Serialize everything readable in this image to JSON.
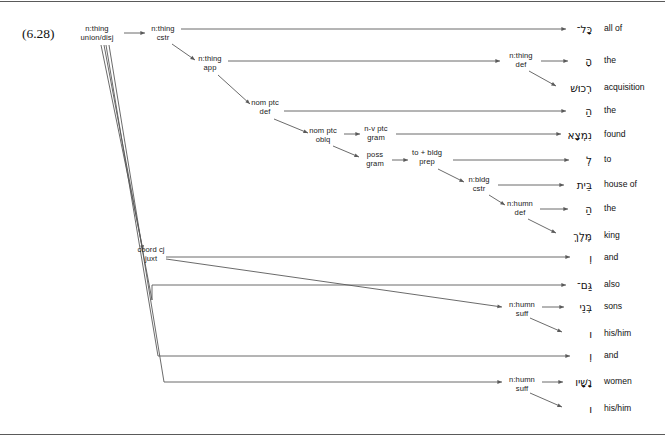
{
  "figure": {
    "number": "(6.28)",
    "width": 665,
    "height": 436,
    "line_color": "#5a5a5a",
    "text_color": "#111111"
  },
  "nodes": [
    {
      "id": "root",
      "line1": "n:thing",
      "line2": "union/disj",
      "x": 97,
      "y": 34
    },
    {
      "id": "thing-cstr",
      "line1": "n:thing",
      "line2": "cstr",
      "x": 163,
      "y": 34
    },
    {
      "id": "thing-app",
      "line1": "n:thing",
      "line2": "app",
      "x": 210,
      "y": 64
    },
    {
      "id": "nom-ptc-def",
      "line1": "nom ptc",
      "line2": "def",
      "x": 265,
      "y": 108
    },
    {
      "id": "nom-ptc-oblq",
      "line1": "nom ptc",
      "line2": "oblq",
      "x": 323,
      "y": 136
    },
    {
      "id": "nv-ptc-gram",
      "line1": "n-v ptc",
      "line2": "gram",
      "x": 376,
      "y": 134
    },
    {
      "id": "poss-gram",
      "line1": "poss",
      "line2": "gram",
      "x": 375,
      "y": 160
    },
    {
      "id": "to-bldg-prep",
      "line1": "to + bldg",
      "line2": "prep",
      "x": 427,
      "y": 158
    },
    {
      "id": "n-bldg-cstr",
      "line1": "n:bldg",
      "line2": "cstr",
      "x": 479,
      "y": 185
    },
    {
      "id": "n-humn-def",
      "line1": "n:humn",
      "line2": "def",
      "x": 520,
      "y": 209
    },
    {
      "id": "thing-def",
      "line1": "n:thing",
      "line2": "def",
      "x": 521,
      "y": 61
    },
    {
      "id": "coord-cj",
      "line1": "coord cj",
      "line2": "juxt",
      "x": 151,
      "y": 255
    },
    {
      "id": "humn-suff-1",
      "line1": "n:humn",
      "line2": "suff",
      "x": 522,
      "y": 310
    },
    {
      "id": "humn-suff-2",
      "line1": "n:humn",
      "line2": "suff",
      "x": 522,
      "y": 385
    }
  ],
  "leaves": [
    {
      "id": "leaf-kol",
      "hebrew": "כָּל־",
      "gloss": "all of",
      "hx": 592,
      "y": 29
    },
    {
      "id": "leaf-ha-1",
      "hebrew": "הָ",
      "gloss": "the",
      "hx": 592,
      "y": 61
    },
    {
      "id": "leaf-rekush",
      "hebrew": "רְכוּשׁ",
      "gloss": "acquisition",
      "hx": 592,
      "y": 88
    },
    {
      "id": "leaf-ha-2",
      "hebrew": "הַ",
      "gloss": "the",
      "hx": 592,
      "y": 111
    },
    {
      "id": "leaf-nimtsa",
      "hebrew": "נִמְצָא",
      "gloss": "found",
      "hx": 592,
      "y": 135
    },
    {
      "id": "leaf-le",
      "hebrew": "לְ",
      "gloss": "to",
      "hx": 592,
      "y": 160
    },
    {
      "id": "leaf-beit",
      "hebrew": "בֵּית",
      "gloss": "house of",
      "hx": 592,
      "y": 185
    },
    {
      "id": "leaf-ha-3",
      "hebrew": "הַ",
      "gloss": "the",
      "hx": 592,
      "y": 209
    },
    {
      "id": "leaf-melekh",
      "hebrew": "מֶּלֶךְ",
      "gloss": "king",
      "hx": 592,
      "y": 236
    },
    {
      "id": "leaf-ve-1",
      "hebrew": "וְ",
      "gloss": "and",
      "hx": 592,
      "y": 258
    },
    {
      "id": "leaf-gam",
      "hebrew": "גַּם־",
      "gloss": "also",
      "hx": 592,
      "y": 285
    },
    {
      "id": "leaf-bene",
      "hebrew": "בְּנֵי",
      "gloss": "sons",
      "hx": 592,
      "y": 307
    },
    {
      "id": "leaf-vav-1",
      "hebrew": "ו",
      "gloss": "his/him",
      "hx": 592,
      "y": 334
    },
    {
      "id": "leaf-ve-2",
      "hebrew": "וְ",
      "gloss": "and",
      "hx": 592,
      "y": 356
    },
    {
      "id": "leaf-nashav",
      "hebrew": "נָשָׁיו",
      "gloss": "women",
      "hx": 592,
      "y": 382
    },
    {
      "id": "leaf-vav-2",
      "hebrew": "ו",
      "gloss": "his/him",
      "hx": 592,
      "y": 409
    }
  ],
  "gloss_x": 604,
  "edges": [
    {
      "id": "e-root-cstr",
      "from": "root",
      "to": "thing-cstr",
      "kind": "arrow",
      "points": "124,33 145,33"
    },
    {
      "id": "e-cstr-kol",
      "from": "thing-cstr",
      "to": "leaf-kol",
      "kind": "arrow",
      "points": "181,29 566,29"
    },
    {
      "id": "e-cstr-app",
      "from": "thing-cstr",
      "to": "thing-app",
      "kind": "arrow",
      "points": "172,44 195,60"
    },
    {
      "id": "e-app-thingdef",
      "from": "thing-app",
      "to": "thing-def",
      "kind": "arrow",
      "points": "228,61 500,61"
    },
    {
      "id": "e-app-nomptcdef",
      "from": "thing-app",
      "to": "nom-ptc-def",
      "kind": "arrow",
      "points": "218,75 250,104"
    },
    {
      "id": "e-thingdef-ha",
      "from": "thing-def",
      "to": "leaf-ha-1",
      "kind": "arrow",
      "points": "541,61 568,61"
    },
    {
      "id": "e-thingdef-rekush",
      "from": "thing-def",
      "to": "leaf-rekush",
      "kind": "arrow",
      "points": "529,71 556,86"
    },
    {
      "id": "e-nomptcdef-ha2",
      "from": "nom-ptc-def",
      "to": "leaf-ha-2",
      "kind": "arrow",
      "points": "284,111 566,111"
    },
    {
      "id": "e-nomptcdef-oblq",
      "from": "nom-ptc-def",
      "to": "nom-ptc-oblq",
      "kind": "arrow",
      "points": "274,119 308,133"
    },
    {
      "id": "e-oblq-nvptc",
      "from": "nom-ptc-oblq",
      "to": "nv-ptc-gram",
      "kind": "arrow",
      "points": "344,134 360,134"
    },
    {
      "id": "e-nvptc-nimtsa",
      "from": "nv-ptc-gram",
      "to": "leaf-nimtsa",
      "kind": "arrow",
      "points": "396,134 561,134"
    },
    {
      "id": "e-oblq-poss",
      "from": "nom-ptc-oblq",
      "to": "poss-gram",
      "kind": "arrow",
      "points": "333,146 359,157"
    },
    {
      "id": "e-poss-tobldg",
      "from": "poss-gram",
      "to": "to-bldg-prep",
      "kind": "arrow",
      "points": "392,160 408,160"
    },
    {
      "id": "e-tobldg-le",
      "from": "to-bldg-prep",
      "to": "leaf-le",
      "kind": "arrow",
      "points": "453,160 569,160"
    },
    {
      "id": "e-tobldg-nbldg",
      "from": "to-bldg-prep",
      "to": "n-bldg-cstr",
      "kind": "arrow",
      "points": "438,169 464,182"
    },
    {
      "id": "e-nbldg-beit",
      "from": "n-bldg-cstr",
      "to": "leaf-beit",
      "kind": "arrow",
      "points": "498,185 564,185"
    },
    {
      "id": "e-nbldg-nhumndef",
      "from": "n-bldg-cstr",
      "to": "n-humn-def",
      "kind": "arrow",
      "points": "489,195 505,205"
    },
    {
      "id": "e-nhumndef-ha3",
      "from": "n-humn-def",
      "to": "leaf-ha-3",
      "kind": "arrow",
      "points": "540,209 568,209"
    },
    {
      "id": "e-nhumndef-melekh",
      "from": "n-humn-def",
      "to": "leaf-melekh",
      "kind": "arrow",
      "points": "528,219 556,233"
    },
    {
      "id": "e-root-coord",
      "from": "root",
      "to": "coord-cj",
      "kind": "arrow",
      "points": "101,45 143,250"
    },
    {
      "id": "e-coord-ve1",
      "from": "coord-cj",
      "to": "leaf-ve-1",
      "kind": "arrow",
      "points": "166,257 570,257"
    },
    {
      "id": "e-coord-bene",
      "from": "coord-cj",
      "to": "humn-suff-1",
      "kind": "arrow",
      "points": "166,259 502,307"
    },
    {
      "id": "e-humnsuff1-bene",
      "from": "humn-suff-1",
      "to": "leaf-bene",
      "kind": "arrow",
      "points": "542,307 564,307"
    },
    {
      "id": "e-humnsuff1-vav",
      "from": "humn-suff-1",
      "to": "leaf-vav-1",
      "kind": "arrow",
      "points": "530,318 562,332"
    },
    {
      "id": "e-root-gam",
      "from": "root",
      "to": "leaf-gam",
      "kind": "arrow",
      "points": "104,45 152,300 152,285 566,285"
    },
    {
      "id": "e-root-ve2",
      "from": "root",
      "to": "leaf-ve-2",
      "kind": "arrow",
      "points": "106,45 158,356 570,356"
    },
    {
      "id": "e-root-nashav",
      "from": "root",
      "to": "humn-suff-2",
      "kind": "arrow",
      "points": "109,45 164,382 502,382"
    },
    {
      "id": "e-humnsuff2-nashav",
      "from": "humn-suff-2",
      "to": "leaf-nashav",
      "kind": "arrow",
      "points": "542,382 563,382"
    },
    {
      "id": "e-humnsuff2-vav",
      "from": "humn-suff-2",
      "to": "leaf-vav-2",
      "kind": "arrow",
      "points": "530,393 562,407"
    }
  ]
}
